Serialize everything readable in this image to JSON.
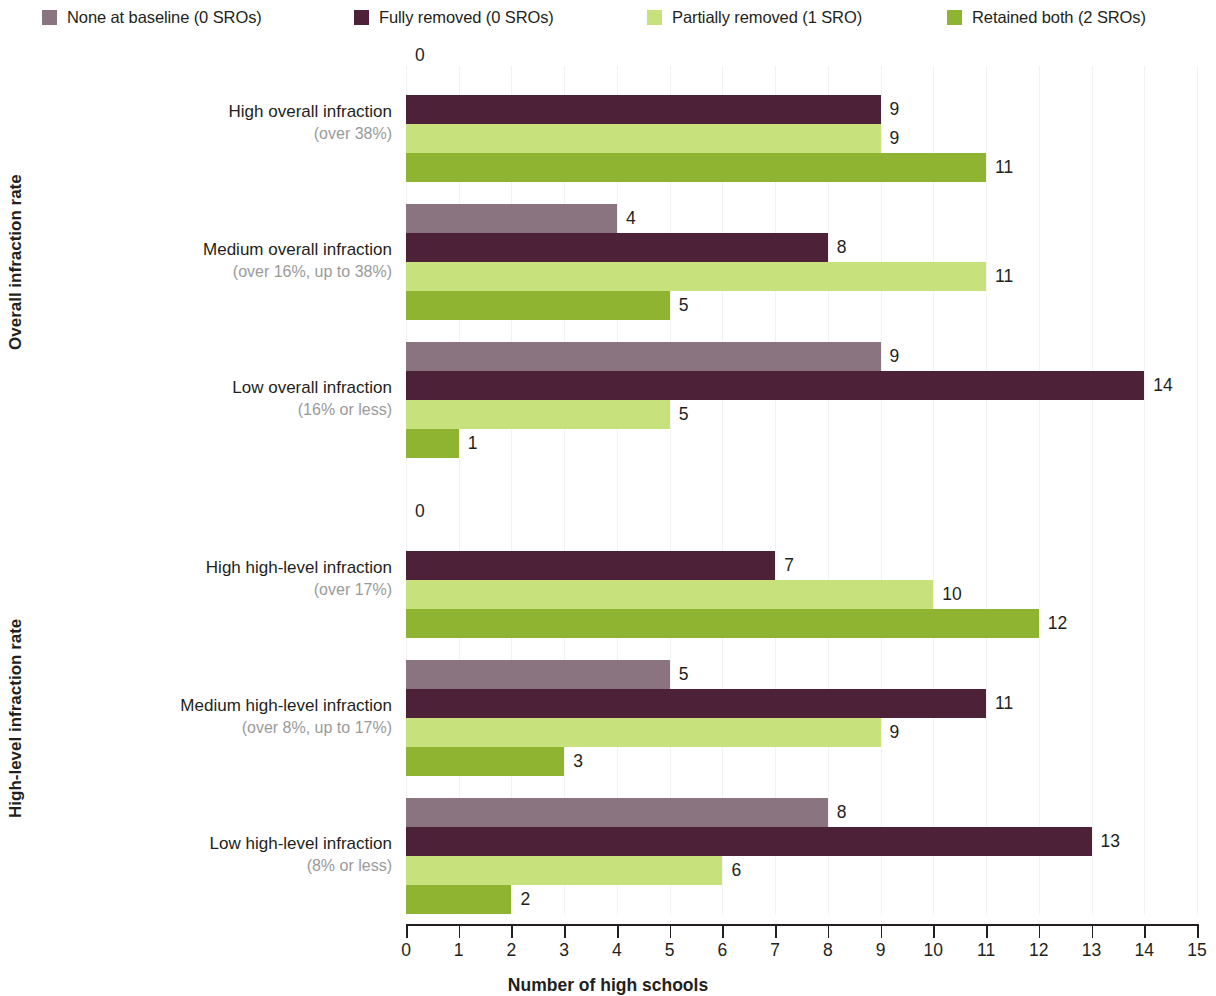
{
  "legend": {
    "items": [
      {
        "label": "None at baseline (0 SROs)",
        "color": "#8a7480",
        "x": 42
      },
      {
        "label": "Fully removed (0 SROs)",
        "color": "#4d2238",
        "x": 354
      },
      {
        "label": "Partially removed (1 SRO)",
        "color": "#c7e27c",
        "x": 647
      },
      {
        "label": "Retained both (2 SROs)",
        "color": "#8fb431",
        "x": 947
      }
    ]
  },
  "chart_data": {
    "type": "bar",
    "orientation": "horizontal",
    "title": "",
    "xlabel": "Number of high schools",
    "ylabel": "",
    "xlim": [
      0,
      15
    ],
    "xticks": [
      0,
      1,
      2,
      3,
      4,
      5,
      6,
      7,
      8,
      9,
      10,
      11,
      12,
      13,
      14,
      15
    ],
    "grid": true,
    "legend_position": "top",
    "series": [
      {
        "name": "None at baseline (0 SROs)",
        "color": "#8a7480"
      },
      {
        "name": "Fully removed (0 SROs)",
        "color": "#4d2238"
      },
      {
        "name": "Partially removed (1 SRO)",
        "color": "#c7e27c"
      },
      {
        "name": "Retained both (2 SROs)",
        "color": "#8fb431"
      }
    ],
    "sections": [
      {
        "axis_title": "Overall infraction rate",
        "groups": [
          {
            "label": "High overall infraction",
            "sublabel": "(over 38%)",
            "values": [
              0,
              9,
              9,
              11
            ]
          },
          {
            "label": "Medium overall infraction",
            "sublabel": "(over 16%, up to 38%)",
            "values": [
              4,
              8,
              11,
              5
            ]
          },
          {
            "label": "Low overall infraction",
            "sublabel": "(16% or less)",
            "values": [
              9,
              14,
              5,
              1
            ]
          }
        ]
      },
      {
        "axis_title": "High-level infraction rate",
        "groups": [
          {
            "label": "High high-level infraction",
            "sublabel": "(over 17%)",
            "values": [
              0,
              7,
              10,
              12
            ]
          },
          {
            "label": "Medium high-level infraction",
            "sublabel": "(over 8%, up to 17%)",
            "values": [
              5,
              11,
              9,
              3
            ]
          },
          {
            "label": "Low high-level infraction",
            "sublabel": "(8% or less)",
            "values": [
              8,
              13,
              6,
              2
            ]
          }
        ]
      }
    ]
  }
}
